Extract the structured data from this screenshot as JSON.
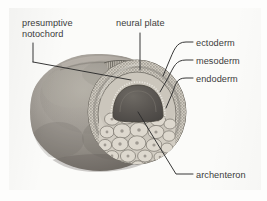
{
  "figure": {
    "background_color": "#fbfbf9",
    "line_color": "#2c2c2c",
    "text_color": "#3b3b3b"
  },
  "labels": {
    "presumptive_notochord": "presumptive\nnotochord",
    "neural_plate": "neural plate",
    "ectoderm": "ectoderm",
    "mesoderm": "mesoderm",
    "endoderm": "endoderm",
    "archenteron": "archenteron"
  },
  "structures": {
    "embryo_body": "embryo-body",
    "cut_face": "cut-face",
    "ectoderm_ring": "ectoderm-cell-ring",
    "endoderm_mass": "endoderm-yolk-cell-mass",
    "archenteron_cavity": "archenteron-cavity",
    "neural_plate_surface": "neural-plate-columnar-cells",
    "notochord_band": "notochord-band"
  },
  "colors": {
    "body_light": "#b9b4ab",
    "body_mid": "#8d8981",
    "body_dark": "#6f6b64",
    "cavity_dark": "#58544f",
    "cell_fill": "#cfcac0",
    "cell_outline": "#7b776f",
    "stipple": "#6d6962"
  }
}
